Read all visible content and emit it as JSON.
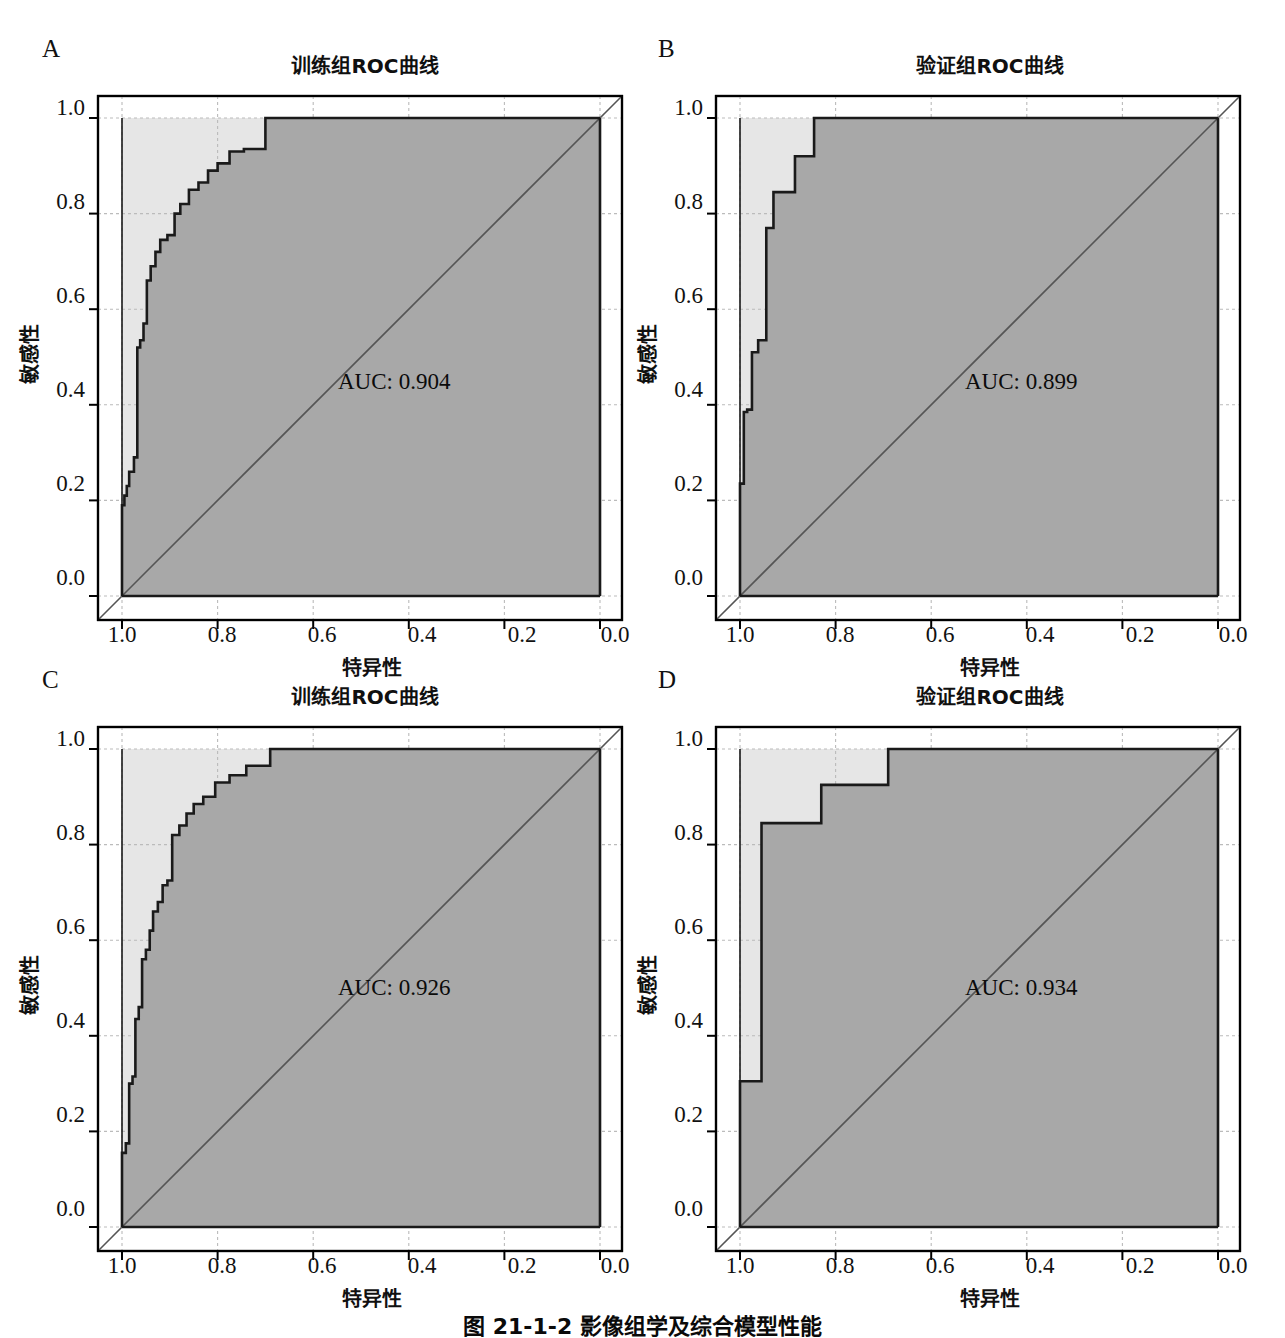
{
  "figure": {
    "caption": "图 21-1-2  影像组学及综合模型性能",
    "panel_letters": [
      "A",
      "B",
      "C",
      "D"
    ],
    "colors": {
      "roc_fill": "#a8a8a8",
      "background_fill": "#e6e6e6",
      "curve_line": "#1a1a1a",
      "diagonal_line": "#555555",
      "axis": "#000000",
      "grid": "#bbbbbb"
    }
  },
  "panels": [
    {
      "letter": "A",
      "title": "训练组ROC曲线",
      "auc_label": "AUC: 0.904",
      "xlabel": "特异性",
      "ylabel": "敏感性"
    },
    {
      "letter": "B",
      "title": "验证组ROC曲线",
      "auc_label": "AUC: 0.899",
      "xlabel": "特异性",
      "ylabel": "敏感性"
    },
    {
      "letter": "C",
      "title": "训练组ROC曲线",
      "auc_label": "AUC: 0.926",
      "xlabel": "特异性",
      "ylabel": "敏感性"
    },
    {
      "letter": "D",
      "title": "验证组ROC曲线",
      "auc_label": "AUC: 0.934",
      "xlabel": "特异性",
      "ylabel": "敏感性"
    }
  ],
  "axis_ticks": {
    "x": [
      "1.0",
      "0.8",
      "0.6",
      "0.4",
      "0.2",
      "0.0"
    ],
    "y": [
      "1.0",
      "0.8",
      "0.6",
      "0.4",
      "0.2",
      "0.0"
    ]
  },
  "chart_data": [
    {
      "id": "panel-a",
      "type": "line",
      "title": "训练组ROC曲线",
      "xlabel": "特异性",
      "ylabel": "敏感性",
      "xlim": [
        1.0,
        0.0
      ],
      "ylim": [
        0.0,
        1.0
      ],
      "x_reversed": true,
      "grid": true,
      "legend": "none",
      "annotations": [
        "AUC: 0.904"
      ],
      "auc": 0.904,
      "reference_line": {
        "from": [
          1.0,
          0.0
        ],
        "to": [
          0.0,
          1.0
        ]
      },
      "series": [
        {
          "name": "训练组ROC曲线",
          "x_specificity": [
            1.0,
            0.995,
            0.99,
            0.985,
            0.975,
            0.968,
            0.962,
            0.955,
            0.948,
            0.94,
            0.93,
            0.92,
            0.905,
            0.89,
            0.878,
            0.86,
            0.84,
            0.82,
            0.8,
            0.775,
            0.745,
            0.7,
            0.655,
            0.0
          ],
          "y_sensitivity": [
            0.0,
            0.19,
            0.21,
            0.23,
            0.26,
            0.29,
            0.52,
            0.535,
            0.57,
            0.66,
            0.69,
            0.72,
            0.745,
            0.755,
            0.8,
            0.82,
            0.85,
            0.865,
            0.89,
            0.905,
            0.93,
            0.935,
            1.0,
            1.0
          ]
        }
      ]
    },
    {
      "id": "panel-b",
      "type": "line",
      "title": "验证组ROC曲线",
      "xlabel": "特异性",
      "ylabel": "敏感性",
      "xlim": [
        1.0,
        0.0
      ],
      "ylim": [
        0.0,
        1.0
      ],
      "x_reversed": true,
      "grid": true,
      "legend": "none",
      "annotations": [
        "AUC: 0.899"
      ],
      "auc": 0.899,
      "reference_line": {
        "from": [
          1.0,
          0.0
        ],
        "to": [
          0.0,
          1.0
        ]
      },
      "series": [
        {
          "name": "验证组ROC曲线",
          "x_specificity": [
            1.0,
            0.992,
            0.985,
            0.975,
            0.962,
            0.945,
            0.93,
            0.885,
            0.845,
            0.455,
            0.0
          ],
          "y_sensitivity": [
            0.0,
            0.235,
            0.385,
            0.39,
            0.51,
            0.535,
            0.77,
            0.845,
            0.92,
            1.0,
            1.0
          ]
        }
      ]
    },
    {
      "id": "panel-c",
      "type": "line",
      "title": "训练组ROC曲线",
      "xlabel": "特异性",
      "ylabel": "敏感性",
      "xlim": [
        1.0,
        0.0
      ],
      "ylim": [
        0.0,
        1.0
      ],
      "x_reversed": true,
      "grid": true,
      "legend": "none",
      "annotations": [
        "AUC: 0.926"
      ],
      "auc": 0.926,
      "reference_line": {
        "from": [
          1.0,
          0.0
        ],
        "to": [
          0.0,
          1.0
        ]
      },
      "series": [
        {
          "name": "训练组ROC曲线",
          "x_specificity": [
            1.0,
            0.992,
            0.985,
            0.978,
            0.972,
            0.965,
            0.958,
            0.95,
            0.942,
            0.935,
            0.925,
            0.915,
            0.905,
            0.895,
            0.88,
            0.865,
            0.85,
            0.83,
            0.805,
            0.775,
            0.74,
            0.69,
            0.64,
            0.0
          ],
          "y_sensitivity": [
            0.0,
            0.155,
            0.175,
            0.3,
            0.315,
            0.435,
            0.46,
            0.56,
            0.58,
            0.62,
            0.66,
            0.68,
            0.715,
            0.725,
            0.82,
            0.84,
            0.865,
            0.885,
            0.9,
            0.93,
            0.945,
            0.965,
            1.0,
            1.0
          ]
        }
      ]
    },
    {
      "id": "panel-d",
      "type": "line",
      "title": "验证组ROC曲线",
      "xlabel": "特异性",
      "ylabel": "敏感性",
      "xlim": [
        1.0,
        0.0
      ],
      "ylim": [
        0.0,
        1.0
      ],
      "x_reversed": true,
      "grid": true,
      "legend": "none",
      "annotations": [
        "AUC: 0.934"
      ],
      "auc": 0.934,
      "reference_line": {
        "from": [
          1.0,
          0.0
        ],
        "to": [
          0.0,
          1.0
        ]
      },
      "series": [
        {
          "name": "验证组ROC曲线",
          "x_specificity": [
            1.0,
            0.955,
            0.87,
            0.83,
            0.69,
            0.0
          ],
          "y_sensitivity": [
            0.0,
            0.305,
            0.845,
            0.845,
            0.925,
            1.0
          ]
        }
      ]
    }
  ]
}
